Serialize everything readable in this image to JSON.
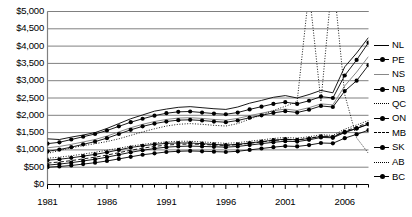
{
  "chart_data": {
    "type": "line",
    "title": "",
    "xlabel": "",
    "ylabel": "",
    "xlim": [
      1981,
      2008
    ],
    "ylim": [
      0,
      5000
    ],
    "ytick_step": 500,
    "grid": true,
    "legend_position": "right",
    "currency_prefix": "$",
    "yticks": [
      "$5,000",
      "$4,500",
      "$4,000",
      "$3,500",
      "$3,000",
      "$2,500",
      "$2,000",
      "$1,500",
      "$1,000",
      "$500",
      "$0"
    ],
    "ytick_values": [
      5000,
      4500,
      4000,
      3500,
      3000,
      2500,
      2000,
      1500,
      1000,
      500,
      0
    ],
    "xticks": [
      "1981",
      "1986",
      "1991",
      "1996",
      "2001",
      "2006"
    ],
    "xtick_values": [
      1981,
      1986,
      1991,
      1996,
      2001,
      2006
    ],
    "x": [
      1981,
      1982,
      1983,
      1984,
      1985,
      1986,
      1987,
      1988,
      1989,
      1990,
      1991,
      1992,
      1993,
      1994,
      1995,
      1996,
      1997,
      1998,
      1999,
      2000,
      2001,
      2002,
      2003,
      2004,
      2005,
      2006,
      2007,
      2008
    ],
    "series": [
      {
        "name": "NL",
        "style": "solid",
        "marker": "none",
        "values": [
          1320,
          1300,
          1370,
          1430,
          1500,
          1620,
          1760,
          1900,
          2010,
          2120,
          2180,
          2230,
          2250,
          2220,
          2190,
          2170,
          2240,
          2350,
          2430,
          2520,
          2570,
          2500,
          2600,
          2720,
          2650,
          3400,
          3800,
          4250
        ]
      },
      {
        "name": "PE",
        "style": "solid",
        "marker": "dot",
        "values": [
          1180,
          1220,
          1300,
          1380,
          1460,
          1560,
          1680,
          1800,
          1900,
          1990,
          2060,
          2100,
          2110,
          2080,
          2050,
          2030,
          2080,
          2170,
          2250,
          2330,
          2380,
          2330,
          2420,
          2540,
          2500,
          3150,
          3600,
          4100
        ]
      },
      {
        "name": "NS",
        "style": "solid-light",
        "marker": "none",
        "values": [
          1060,
          1100,
          1160,
          1230,
          1300,
          1400,
          1520,
          1640,
          1740,
          1820,
          1880,
          1920,
          1930,
          1910,
          1880,
          1860,
          1910,
          1990,
          2060,
          2130,
          2180,
          2140,
          2220,
          2330,
          2300,
          2850,
          3250,
          3700
        ]
      },
      {
        "name": "NB",
        "style": "solid",
        "marker": "dot",
        "values": [
          960,
          1010,
          1080,
          1160,
          1240,
          1340,
          1460,
          1580,
          1680,
          1760,
          1820,
          1860,
          1870,
          1850,
          1820,
          1800,
          1850,
          1930,
          2000,
          2070,
          2120,
          2080,
          2160,
          2270,
          2240,
          2700,
          3000,
          3450
        ]
      },
      {
        "name": "QC",
        "style": "dotted",
        "marker": "none",
        "values": [
          760,
          790,
          830,
          880,
          930,
          990,
          1050,
          1110,
          1160,
          1200,
          1230,
          1250,
          1250,
          1230,
          1210,
          1190,
          1210,
          1250,
          1290,
          1330,
          1360,
          1340,
          1380,
          1440,
          1420,
          1600,
          1720,
          1850
        ]
      },
      {
        "name": "ON",
        "style": "solid",
        "marker": "dot",
        "values": [
          700,
          730,
          770,
          820,
          870,
          930,
          1000,
          1070,
          1120,
          1160,
          1190,
          1200,
          1200,
          1180,
          1160,
          1140,
          1160,
          1200,
          1240,
          1280,
          1310,
          1290,
          1330,
          1390,
          1370,
          1520,
          1620,
          1740
        ]
      },
      {
        "name": "MB",
        "style": "dashed",
        "marker": "none",
        "values": [
          620,
          650,
          690,
          740,
          790,
          850,
          920,
          990,
          1050,
          1100,
          1140,
          1160,
          1170,
          1160,
          1140,
          1130,
          1150,
          1190,
          1230,
          1270,
          1300,
          1290,
          1330,
          1400,
          1390,
          1540,
          1660,
          1790
        ]
      },
      {
        "name": "SK",
        "style": "solid",
        "marker": "dot",
        "values": [
          560,
          590,
          630,
          680,
          730,
          790,
          860,
          930,
          990,
          1040,
          1080,
          1100,
          1110,
          1100,
          1090,
          1080,
          1100,
          1140,
          1180,
          1220,
          1250,
          1240,
          1290,
          1360,
          1350,
          1500,
          1620,
          1750
        ]
      },
      {
        "name": "AB",
        "style": "dotted",
        "marker": "none",
        "values": [
          900,
          980,
          1060,
          1120,
          1180,
          1240,
          1320,
          1420,
          1520,
          1610,
          1690,
          1740,
          1760,
          1740,
          1710,
          1690,
          1760,
          1890,
          2010,
          2140,
          2260,
          2400,
          5600,
          2400,
          6100,
          2600,
          1350,
          900
        ]
      },
      {
        "name": "BC",
        "style": "solid",
        "marker": "dot",
        "values": [
          500,
          520,
          550,
          590,
          630,
          680,
          740,
          800,
          860,
          900,
          940,
          960,
          970,
          960,
          950,
          940,
          960,
          1000,
          1040,
          1080,
          1110,
          1100,
          1140,
          1200,
          1190,
          1340,
          1450,
          1570
        ]
      }
    ]
  }
}
